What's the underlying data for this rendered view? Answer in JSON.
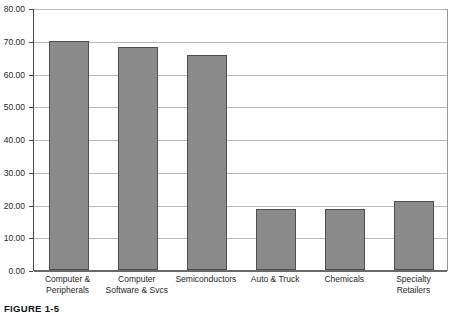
{
  "caption": "FIGURE 1-5",
  "chart_data": {
    "type": "bar",
    "title": "",
    "xlabel": "",
    "ylabel": "",
    "categories": [
      "Computer & Peripherals",
      "Computer Software & Svcs",
      "Semiconductors",
      "Auto & Truck",
      "Chemicals",
      "Specialty Retailers"
    ],
    "values": [
      69.8,
      68.2,
      65.7,
      18.7,
      18.7,
      21.0
    ],
    "ylim": [
      0,
      80
    ],
    "ytick_values": [
      0,
      10,
      20,
      30,
      40,
      50,
      60,
      70,
      80
    ],
    "ytick_labels": [
      "0.00",
      "10.00",
      "20.00",
      "30.00",
      "40.00",
      "50.00",
      "60.00",
      "70.00",
      "80.00"
    ],
    "grid": true,
    "legend": null,
    "bar_color": "#8a8a8a",
    "bar_border_color": "#4f4f4f",
    "gridline_color": "#b9b9b9",
    "axis_color": "#4a4a4a",
    "plot_background": "#ffffff"
  }
}
